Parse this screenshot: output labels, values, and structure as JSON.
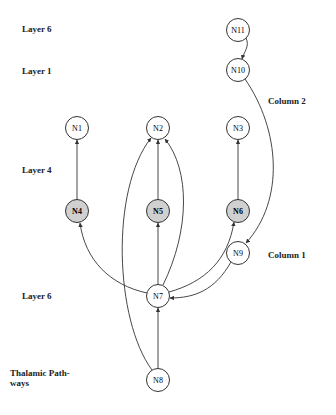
{
  "labels": {
    "layer6_top": "Layer 6",
    "layer1": "Layer 1",
    "column2": "Column 2",
    "layer4": "Layer 4",
    "column1": "Column 1",
    "layer6_bottom": "Layer 6",
    "thalamic_line1": "Thalamic Path-",
    "thalamic_line2": "ways"
  },
  "colors": {
    "stroke": "#333333",
    "node_fill": "#ffffff",
    "shaded_fill": "#d0d0d0"
  },
  "nodes": [
    {
      "id": "N11",
      "label": "N11",
      "x": 238,
      "y": 30,
      "shaded": false
    },
    {
      "id": "N10",
      "label": "N10",
      "x": 238,
      "y": 70,
      "shaded": false
    },
    {
      "id": "N1",
      "label": "N1",
      "x": 77,
      "y": 128,
      "shaded": false
    },
    {
      "id": "N2",
      "label": "N2",
      "x": 158,
      "y": 128,
      "shaded": false
    },
    {
      "id": "N3",
      "label": "N3",
      "x": 238,
      "y": 128,
      "shaded": false
    },
    {
      "id": "N4",
      "label": "N4",
      "x": 77,
      "y": 211,
      "shaded": true
    },
    {
      "id": "N5",
      "label": "N5",
      "x": 158,
      "y": 211,
      "shaded": true
    },
    {
      "id": "N6",
      "label": "N6",
      "x": 238,
      "y": 211,
      "shaded": true
    },
    {
      "id": "N9",
      "label": "N9",
      "x": 238,
      "y": 253,
      "shaded": false
    },
    {
      "id": "N7",
      "label": "N7",
      "x": 158,
      "y": 296,
      "shaded": false
    },
    {
      "id": "N8",
      "label": "N8",
      "x": 158,
      "y": 380,
      "shaded": false
    }
  ],
  "edges": [
    {
      "from": "N11",
      "to": "N10"
    },
    {
      "from": "N10",
      "to": "N9"
    },
    {
      "from": "N4",
      "to": "N1"
    },
    {
      "from": "N5",
      "to": "N2"
    },
    {
      "from": "N6",
      "to": "N3"
    },
    {
      "from": "N7",
      "to": "N4"
    },
    {
      "from": "N7",
      "to": "N5"
    },
    {
      "from": "N7",
      "to": "N2"
    },
    {
      "from": "N7",
      "to": "N6"
    },
    {
      "from": "N9",
      "to": "N7"
    },
    {
      "from": "N8",
      "to": "N7"
    },
    {
      "from": "N8",
      "to": "N2"
    }
  ]
}
